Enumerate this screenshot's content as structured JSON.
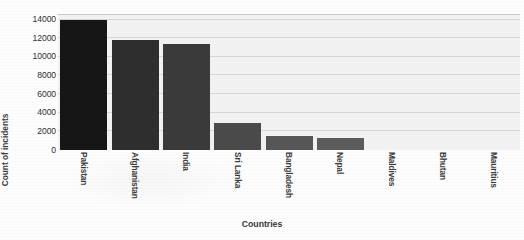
{
  "chart_data": {
    "type": "bar",
    "title": "",
    "xlabel": "Countries",
    "ylabel": "Count of incidents",
    "categories": [
      "Pakistan",
      "Afghanistan",
      "India",
      "Sri Lanka",
      "Bangladesh",
      "Nepal",
      "Maldives",
      "Bhutan",
      "Mauritius"
    ],
    "values": [
      14000,
      11800,
      11400,
      2900,
      1500,
      1300,
      0,
      0,
      0
    ],
    "ylim": [
      0,
      14600
    ],
    "yticks": [
      0,
      2000,
      4000,
      6000,
      8000,
      10000,
      12000,
      14000
    ],
    "ytick_labels": [
      "0",
      "2000",
      "4000",
      "6000",
      "8000",
      "10000",
      "12000",
      "14000"
    ],
    "grid": true,
    "grid_axis": "y",
    "legend": false,
    "bar_colors": [
      "#161616",
      "#2e2e2e",
      "#3a3a3a",
      "#4a4a4a",
      "#565656",
      "#5c5c5c",
      "#5c5c5c",
      "#5c5c5c",
      "#5c5c5c"
    ],
    "plot_background": "#f1f1f1",
    "figure_background": "#fdfdfd"
  },
  "axes": {
    "y_title": "Count of incidents",
    "x_title": "Countries"
  }
}
